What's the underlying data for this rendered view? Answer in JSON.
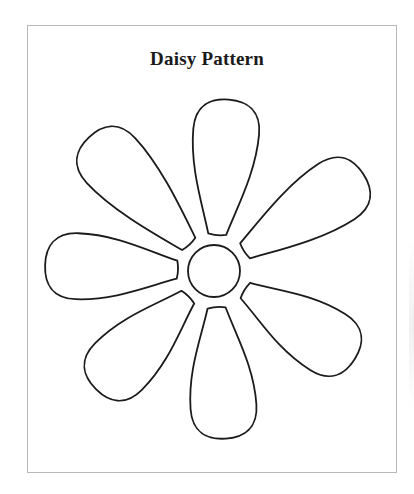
{
  "document": {
    "title": "Daisy Pattern"
  },
  "pattern": {
    "shape": "daisy",
    "petal_count": 7,
    "center": {
      "cx": 214,
      "cy": 271,
      "r": 26
    },
    "petals": [
      {
        "name": "top",
        "angle": 5,
        "length": 172
      },
      {
        "name": "upper-right",
        "angle": 57,
        "length": 178
      },
      {
        "name": "lower-right",
        "angle": 122,
        "length": 166
      },
      {
        "name": "bottom",
        "angle": 176,
        "length": 168
      },
      {
        "name": "lower-left",
        "angle": 225,
        "length": 167
      },
      {
        "name": "left",
        "angle": 272,
        "length": 169
      },
      {
        "name": "upper-left",
        "angle": 317,
        "length": 183
      }
    ],
    "stroke_color": "#1b1b1b",
    "border_color": "#b8b8b8"
  }
}
